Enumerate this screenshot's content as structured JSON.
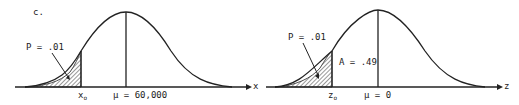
{
  "panel_label": "c.",
  "left": {
    "p_label": "P = .01",
    "x_label": "x",
    "x0": "x",
    "x0_sub": "o",
    "mu_label": "μ = 60,000"
  },
  "right": {
    "p_label": "P = .01",
    "a_label": "A = .49",
    "axis_label": "z",
    "z0": "z",
    "z0_sub": "o",
    "mu_label": "μ = 0"
  },
  "colors": {
    "line": "#222222",
    "hatch": "#333333"
  }
}
